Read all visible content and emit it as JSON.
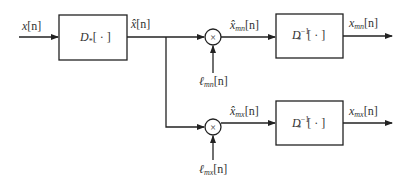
{
  "diagram": {
    "input": {
      "label": "x[n]",
      "base": "x",
      "arg": "[n]"
    },
    "forward_block": {
      "label": "D*[ · ]",
      "op": "D",
      "sub": "*",
      "arg": "[ · ]"
    },
    "intermediate": {
      "label": "x̂[n]",
      "base": "x̂",
      "arg": "[n]"
    },
    "branches": [
      {
        "id": "mn",
        "multiplier": {
          "symbol": "×"
        },
        "gain": {
          "label": "ℓ_mn[n]",
          "base": "ℓ",
          "sub": "mn",
          "arg": "[n]"
        },
        "product": {
          "label": "x̂_mn[n]",
          "base": "x̂",
          "sub": "mn",
          "arg": "[n]"
        },
        "inverse_block": {
          "label": "D*^-1[ · ]",
          "op": "D",
          "sub": "*",
          "sup": "−1",
          "arg": "[ · ]"
        },
        "output": {
          "label": "x_mn[n]",
          "base": "x",
          "sub": "mn",
          "arg": "[n]"
        }
      },
      {
        "id": "mx",
        "multiplier": {
          "symbol": "×"
        },
        "gain": {
          "label": "ℓ_mx[n]",
          "base": "ℓ",
          "sub": "mx",
          "arg": "[n]"
        },
        "product": {
          "label": "x̂_mx[n]",
          "base": "x̂",
          "sub": "mx",
          "arg": "[n]"
        },
        "inverse_block": {
          "label": "D*^-1[ · ]",
          "op": "D",
          "sub": "*",
          "sup": "−1",
          "arg": "[ · ]"
        },
        "output": {
          "label": "x_mx[n]",
          "base": "x",
          "sub": "mx",
          "arg": "[n]"
        }
      }
    ]
  }
}
